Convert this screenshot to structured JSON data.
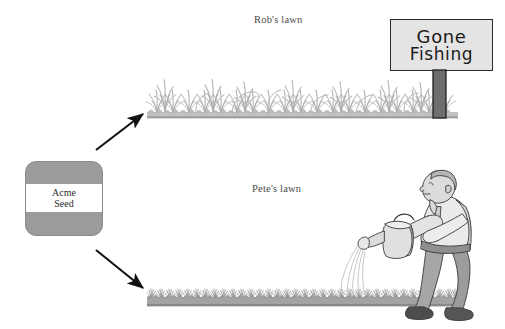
{
  "figure": {
    "canvas_width": 505,
    "canvas_height": 329,
    "background_color": "#ffffff",
    "type": "illustration-diagram"
  },
  "source": {
    "label": "Acme Seed",
    "line1": "Acme",
    "line2": "Seed",
    "box_color": "#9b9b9b",
    "band_color": "#ffffff"
  },
  "branches": [
    {
      "id": "rob",
      "label": "Rob's lawn",
      "arrow_direction": "up-right",
      "grass_state": "tall overgrown wild",
      "grass_color": "#b6b6b6"
    },
    {
      "id": "pete",
      "label": "Pete's lawn",
      "arrow_direction": "down-right",
      "grass_state": "short dense trimmed",
      "grass_color": "#9a9a9a"
    }
  ],
  "sign": {
    "line1": "Gone",
    "line2": "Fishing",
    "board_color": "#e4e4e4",
    "post_color": "#6e6e6e",
    "outline_color": "#2a2a2a"
  },
  "person": {
    "name": "gardener-watering",
    "action": "watering the lawn with a watering can",
    "skin_color": "#dcdcdc",
    "shirt_color": "#e8e8e8",
    "pants_color": "#9c9c9c",
    "shoe_color": "#555555",
    "water_color": "#c9c9c9"
  },
  "arrows": {
    "color": "#111111",
    "up_arrow_name": "arrow-to-robs-lawn",
    "down_arrow_name": "arrow-to-petes-lawn"
  }
}
